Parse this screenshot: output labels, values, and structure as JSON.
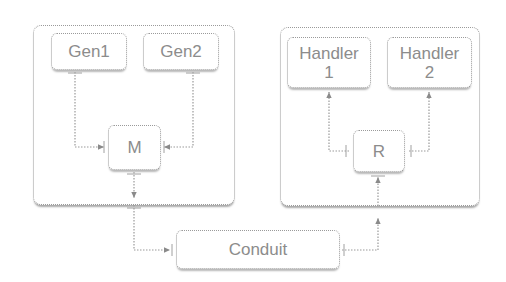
{
  "diagram": {
    "groups": [
      {
        "id": "generators-group",
        "nodes": [
          "Gen1",
          "Gen2",
          "M"
        ]
      },
      {
        "id": "handlers-group",
        "nodes": [
          "Handler 1",
          "Handler 2",
          "R"
        ]
      }
    ],
    "nodes": {
      "gen1": "Gen1",
      "gen2": "Gen2",
      "m": "M",
      "handler1": "Handler\n1",
      "handler2": "Handler\n2",
      "r": "R",
      "conduit": "Conduit"
    },
    "edges": [
      {
        "from": "Gen1",
        "to": "M"
      },
      {
        "from": "Gen2",
        "to": "M"
      },
      {
        "from": "M",
        "to": "Conduit"
      },
      {
        "from": "Conduit",
        "to": "R"
      },
      {
        "from": "R",
        "to": "Handler 1"
      },
      {
        "from": "R",
        "to": "Handler 2"
      }
    ],
    "colors": {
      "line": "#9a9a9a",
      "text": "#8c8c8c",
      "shadow": "#b0b0b0"
    }
  }
}
